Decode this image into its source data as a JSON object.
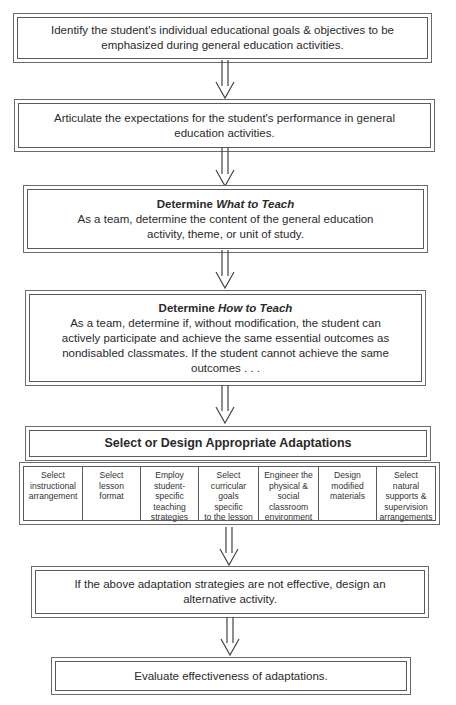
{
  "flowchart": {
    "steps": [
      {
        "id": "identify-goals",
        "text_line1": "Identify the student's individual educational goals & objectives to be",
        "text_line2": "emphasized during general education activities."
      },
      {
        "id": "articulate-expectations",
        "text_line1": "Articulate the expectations for the student's performance in general",
        "text_line2": "education activities."
      },
      {
        "id": "what-to-teach",
        "title_prefix": "Determine ",
        "title_emphasis": "What to Teach",
        "text_line1": "As a team, determine the content of the general education",
        "text_line2": "activity, theme, or unit of study."
      },
      {
        "id": "how-to-teach",
        "title_prefix": "Determine ",
        "title_emphasis": "How to Teach",
        "text_line1": "As a team, determine if, without modification, the student can",
        "text_line2": "actively participate and achieve the same essential outcomes as",
        "text_line3": "nondisabled classmates. If the student cannot achieve the same",
        "text_line4": "outcomes . . ."
      },
      {
        "id": "select-adaptations",
        "title": "Select or Design Appropriate Adaptations",
        "options": [
          {
            "lines": [
              "Select",
              "instructional",
              "arrangement"
            ]
          },
          {
            "lines": [
              "Select",
              "lesson",
              "format"
            ]
          },
          {
            "lines": [
              "Employ",
              "student-",
              "specific",
              "teaching",
              "strategies"
            ]
          },
          {
            "lines": [
              "Select",
              "curricular",
              "goals",
              "specific",
              "to the lesson"
            ]
          },
          {
            "lines": [
              "Engineer the",
              "physical &",
              "social",
              "classroom",
              "environment"
            ]
          },
          {
            "lines": [
              "Design",
              "modified",
              "materials"
            ]
          },
          {
            "lines": [
              "Select",
              "natural",
              "supports &",
              "supervision",
              "arrangements"
            ]
          }
        ]
      },
      {
        "id": "alternative-activity",
        "text_line1": "If the above adaptation strategies are not effective, design an",
        "text_line2": "alternative activity."
      },
      {
        "id": "evaluate",
        "text_line1": "Evaluate effectiveness of adaptations."
      }
    ],
    "arrow_icon": "double-line-down-arrow",
    "colors": {
      "border": "#5a5a5a",
      "text": "#2a2a2a",
      "background": "#ffffff"
    }
  }
}
